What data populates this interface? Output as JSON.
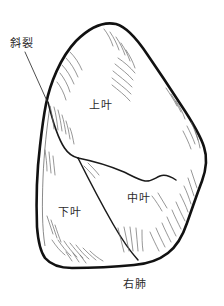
{
  "figure": {
    "title": "右肺",
    "background_color": "#ffffff",
    "outline_color": "#111111",
    "hatch_color": "#5a5a5a",
    "text_color": "#2b2b2b"
  },
  "labels": {
    "oblique_fissure": "斜裂",
    "upper_lobe": "上叶",
    "middle_lobe": "中叶",
    "lower_lobe": "下叶",
    "organ": "右肺"
  }
}
